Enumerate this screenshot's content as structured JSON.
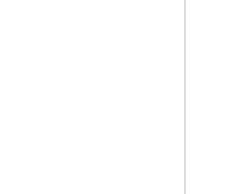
{
  "left_graph": {
    "nodes": [
      {
        "id": "v2",
        "base": "v",
        "sub": "2",
        "x": 24,
        "y": 30
      },
      {
        "id": "v3",
        "base": "v",
        "sub": "3",
        "x": 71,
        "y": 31
      },
      {
        "id": "v1",
        "base": "v",
        "sub": "1",
        "x": 24,
        "y": 80
      },
      {
        "id": "v4",
        "base": "v",
        "sub": "4",
        "x": 80,
        "y": 79
      }
    ],
    "edges": [
      {
        "from": "v2",
        "to": "v1"
      },
      {
        "from": "v1",
        "to": "v3"
      },
      {
        "from": "v3",
        "to": "v4"
      },
      {
        "from": "v4",
        "to": "v1"
      }
    ]
  },
  "right_graph": {
    "nodes": [
      {
        "id": "v2",
        "base": "v",
        "sub": "2",
        "x": 141,
        "y": 52
      },
      {
        "id": "v1",
        "base": "v",
        "sub": "1",
        "x": 173,
        "y": 50
      },
      {
        "id": "v3",
        "base": "v",
        "sub": "3",
        "x": 229,
        "y": 20
      },
      {
        "id": "v4",
        "base": "v",
        "sub": "4",
        "x": 232,
        "y": 80
      }
    ],
    "edges": [
      {
        "from": "v1",
        "to": "v3"
      },
      {
        "from": "v3",
        "to": "v4"
      },
      {
        "from": "v4",
        "to": "v1"
      }
    ]
  },
  "divider": {
    "x": 185
  },
  "stacks": [
    {
      "label": "stack1",
      "x": 86,
      "cells": [
        "",
        "",
        "",
        "",
        "v2"
      ]
    },
    {
      "label": "stack1",
      "x": 131,
      "cells": [
        "",
        "v1",
        "v3",
        "v4",
        "v2"
      ]
    }
  ],
  "colors": {
    "stroke": "#888888",
    "edge": "#999999",
    "text": "#444444"
  }
}
